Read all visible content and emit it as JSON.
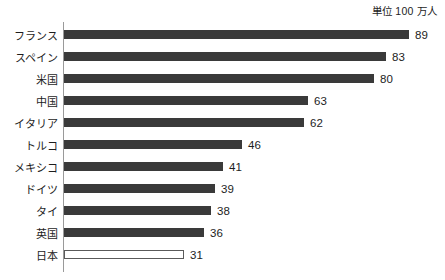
{
  "caption": {
    "unit_note": "単位 100 万人"
  },
  "axis": {
    "line_color": "#9a9a9a"
  },
  "style": {
    "bar_color": "#3a3a3a",
    "bar_outline_color": "#5a5a5a",
    "background": "#ffffff",
    "text_color": "#1d1d1d"
  },
  "chart_data": {
    "type": "bar",
    "orientation": "horizontal",
    "title": "",
    "subtitle": "",
    "xlabel": "",
    "ylabel": "",
    "annotations": [
      "単位 100 万人"
    ],
    "grid": false,
    "legend": false,
    "xlim": [
      0,
      95
    ],
    "categories": [
      "フランス",
      "スペイン",
      "米国",
      "中国",
      "イタリア",
      "トルコ",
      "メキシコ",
      "ドイツ",
      "タイ",
      "英国",
      "日本"
    ],
    "values": [
      89,
      83,
      80,
      63,
      62,
      46,
      41,
      39,
      38,
      36,
      31
    ],
    "value_labels": [
      "89",
      "83",
      "80",
      "63",
      "62",
      "46",
      "41",
      "39",
      "38",
      "36",
      "31"
    ],
    "highlight_index": 10,
    "highlight_style": "hollow"
  }
}
